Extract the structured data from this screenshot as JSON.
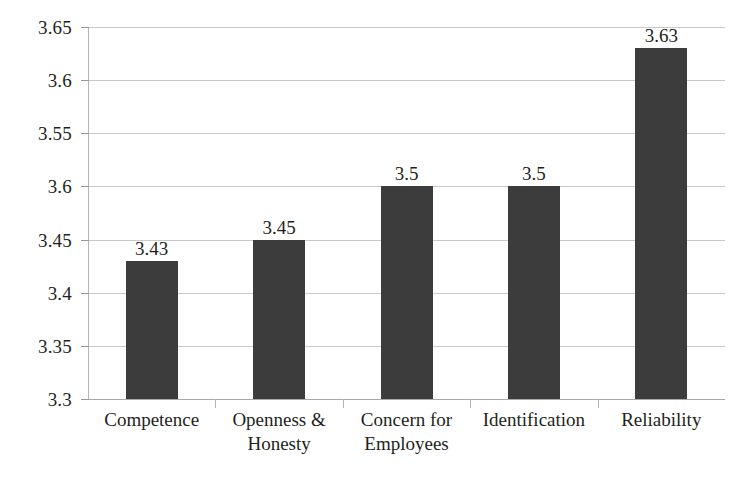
{
  "chart_data": {
    "type": "bar",
    "title": "",
    "subtitle": "",
    "xlabel": "",
    "ylabel": "",
    "categories": [
      "Competence",
      "Openness & Honesty",
      "Concern for Employees",
      "Identification",
      "Reliability"
    ],
    "category_lines": [
      [
        "Competence"
      ],
      [
        "Openness &",
        "Honesty"
      ],
      [
        "Concern for",
        "Employees"
      ],
      [
        "Identification"
      ],
      [
        "Reliability"
      ]
    ],
    "values": [
      3.43,
      3.45,
      3.5,
      3.5,
      3.63
    ],
    "value_labels": [
      "3.43",
      "3.45",
      "3.5",
      "3.5",
      "3.63"
    ],
    "ylim": [
      3.3,
      3.65
    ],
    "ytick_values": [
      3.65,
      3.6,
      3.55,
      3.5,
      3.45,
      3.4,
      3.35,
      3.3
    ],
    "ytick_labels": [
      "3.65",
      "3.6",
      "3.55",
      "3.6",
      "3.45",
      "3.4",
      "3.35",
      "3.3"
    ],
    "grid": true,
    "legend": false,
    "legend_position": "none",
    "bar_color": "#3c3c3c",
    "gridline_color": "#c9c9c9",
    "axis_color": "#b4b4b4",
    "background_color": "#ffffff",
    "text_color": "#231f20"
  }
}
